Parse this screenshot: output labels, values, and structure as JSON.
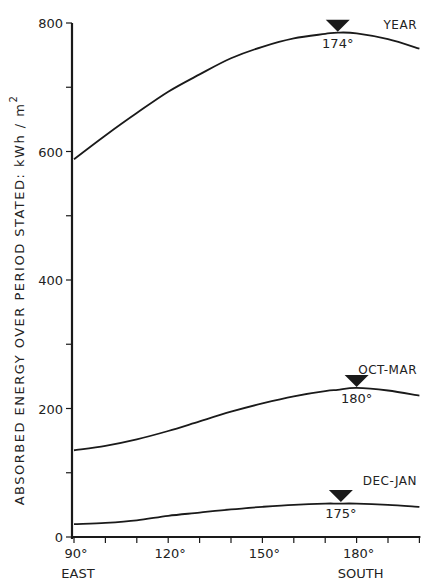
{
  "chart_data": {
    "type": "line",
    "title": "",
    "xlabel": "",
    "ylabel": "ABSORBED ENERGY OVER PERIOD STATED:  kWh / m²",
    "ylabel_parts": {
      "text": "ABSORBED ENERGY OVER PERIOD STATED:  kWh / m",
      "superscript": "2"
    },
    "xlim": [
      90,
      200
    ],
    "ylim": [
      0,
      800
    ],
    "grid": false,
    "legend": "inline labels at right end of each curve",
    "x_ticks": [
      {
        "value": 90,
        "label": "90°",
        "sublabel": "EAST"
      },
      {
        "value": 100,
        "label": ""
      },
      {
        "value": 110,
        "label": ""
      },
      {
        "value": 120,
        "label": "120°"
      },
      {
        "value": 130,
        "label": ""
      },
      {
        "value": 140,
        "label": ""
      },
      {
        "value": 150,
        "label": "150°"
      },
      {
        "value": 160,
        "label": ""
      },
      {
        "value": 170,
        "label": ""
      },
      {
        "value": 180,
        "label": "180°",
        "sublabel": "SOUTH"
      },
      {
        "value": 190,
        "label": ""
      },
      {
        "value": 200,
        "label": ""
      }
    ],
    "y_ticks": [
      {
        "value": 0,
        "label": "0"
      },
      {
        "value": 100,
        "label": ""
      },
      {
        "value": 200,
        "label": "200"
      },
      {
        "value": 300,
        "label": ""
      },
      {
        "value": 400,
        "label": "400"
      },
      {
        "value": 500,
        "label": ""
      },
      {
        "value": 600,
        "label": "600"
      },
      {
        "value": 700,
        "label": ""
      },
      {
        "value": 800,
        "label": "800"
      }
    ],
    "x": [
      90,
      100,
      110,
      120,
      130,
      140,
      150,
      160,
      170,
      174,
      175,
      180,
      190,
      200
    ],
    "series": [
      {
        "name": "YEAR",
        "values": [
          588,
          625,
          660,
          693,
          720,
          745,
          763,
          776,
          783,
          785,
          785,
          784,
          775,
          760
        ],
        "peak": {
          "x": 174,
          "label": "174°"
        }
      },
      {
        "name": "OCT-MAR",
        "values": [
          135,
          142,
          152,
          165,
          180,
          195,
          208,
          219,
          227,
          229,
          230,
          232,
          228,
          220
        ],
        "peak": {
          "x": 180,
          "label": "180°"
        }
      },
      {
        "name": "DEC-JAN",
        "values": [
          20,
          22,
          26,
          33,
          38,
          43,
          47,
          50,
          52,
          52,
          53,
          52,
          50,
          47
        ],
        "peak": {
          "x": 175,
          "label": "175°"
        }
      }
    ],
    "annotations": [
      {
        "type": "triangle-marker",
        "series": "YEAR",
        "x": 174,
        "text": "174°"
      },
      {
        "type": "triangle-marker",
        "series": "OCT-MAR",
        "x": 180,
        "text": "180°"
      },
      {
        "type": "triangle-marker",
        "series": "DEC-JAN",
        "x": 175,
        "text": "175°"
      }
    ]
  },
  "colors": {
    "line": "#1a1a1a",
    "background": "#ffffff"
  }
}
